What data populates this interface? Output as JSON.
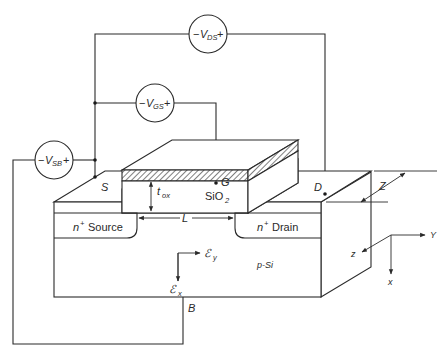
{
  "figure": {
    "type": "MOSFET cross-section schematic with bias sources",
    "line_color": "#2a2a2a",
    "background": "#ffffff"
  },
  "sources": {
    "vds": {
      "minus": "−",
      "symbol": "V",
      "subscript": "DS",
      "plus": "+"
    },
    "vgs": {
      "minus": "−",
      "symbol": "V",
      "subscript": "GS",
      "plus": "+"
    },
    "vsb": {
      "minus": "−",
      "symbol": "V",
      "subscript": "SB",
      "plus": "+"
    }
  },
  "terminals": {
    "source": "S",
    "gate": "G",
    "drain": "D",
    "body": "B"
  },
  "regions": {
    "source": {
      "prefix": "n",
      "sup": "+",
      "name": "Source"
    },
    "drain": {
      "prefix": "n",
      "sup": "+",
      "name": "Drain"
    },
    "oxide": {
      "name": "SiO",
      "sub": "2"
    },
    "substrate": "p-Si"
  },
  "dimensions": {
    "oxide_thickness": {
      "symbol": "t",
      "sub": "ox"
    },
    "channel_length": "L",
    "width": "Z"
  },
  "fields": {
    "ey": {
      "symbol": "ℰ",
      "sub": "y"
    },
    "ex": {
      "symbol": "ℰ",
      "sub": "x"
    }
  },
  "axes": {
    "y": "Y",
    "z": "z",
    "x": "x"
  }
}
